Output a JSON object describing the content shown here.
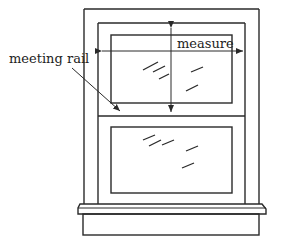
{
  "diagram": {
    "labels": {
      "measure": "measure",
      "meeting_rail": "meeting rail"
    },
    "colors": {
      "stroke": "#2a2a2a",
      "background": "#ffffff"
    },
    "parts": [
      "outer-frame",
      "sash-frame",
      "upper-glass",
      "meeting-rail",
      "lower-glass",
      "sill",
      "apron"
    ]
  }
}
